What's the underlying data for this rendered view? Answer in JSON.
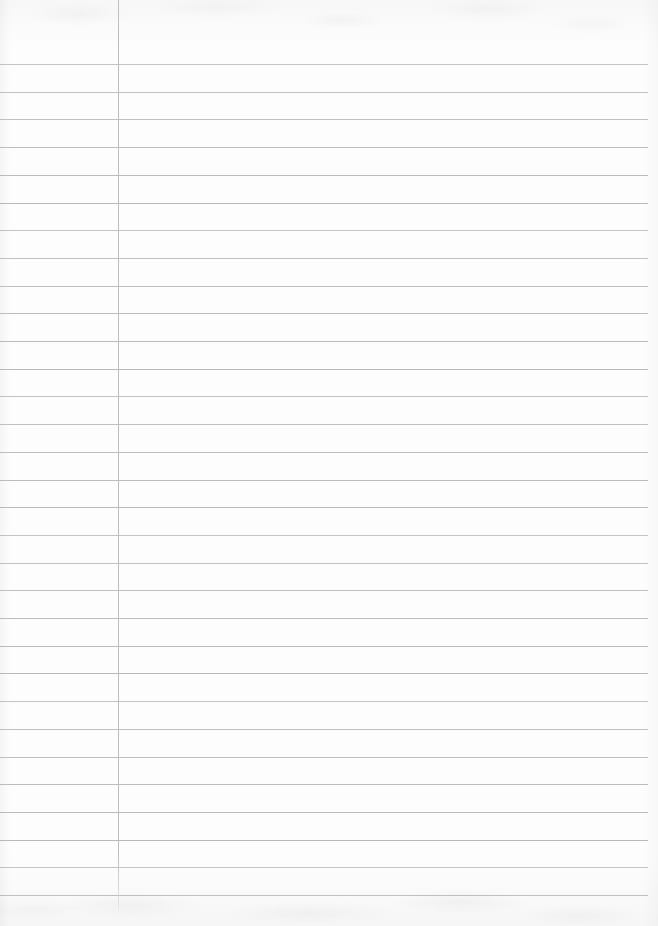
{
  "document": {
    "kind": "scanned-ruled-notebook-page",
    "title": "Blank Ruled Notebook Page",
    "page_width": 658,
    "page_height": 926,
    "content_text": "",
    "handwriting_present": "no",
    "printed_text_present": "no"
  },
  "colors": {
    "paper": "#fbfbfc",
    "paper_highlight": "#fdfdfd",
    "paper_shadow": "#f6f6f7",
    "rule_line": "#b2b6bd",
    "margin_rule": "#bcc0c6",
    "scan_noise": "#94969d"
  },
  "ruling": {
    "style": "wide-ruled",
    "first_line_y": 64,
    "line_spacing": 27.7,
    "line_count": 31,
    "line_thickness": 1,
    "line_left_x": 0,
    "line_right_x": 648,
    "lines_y": [
      64,
      91.7,
      119.4,
      147.1,
      174.8,
      202.5,
      230.2,
      257.9,
      285.6,
      313.3,
      341.0,
      368.7,
      396.4,
      424.1,
      451.8,
      479.5,
      507.2,
      534.9,
      562.6,
      590.3,
      618.0,
      645.7,
      673.4,
      701.1,
      728.8,
      756.5,
      784.2,
      811.9,
      839.6,
      867.3,
      895.0
    ]
  },
  "margin": {
    "has_vertical_rule": "yes",
    "x": 118,
    "top_y": 0,
    "bottom_y": 915,
    "thickness": 1,
    "left_margin_width": 118
  },
  "regions": {
    "top_blank_band_height": 64,
    "bottom_blank_band_height": 28,
    "right_unruled_edge_width": 10
  }
}
